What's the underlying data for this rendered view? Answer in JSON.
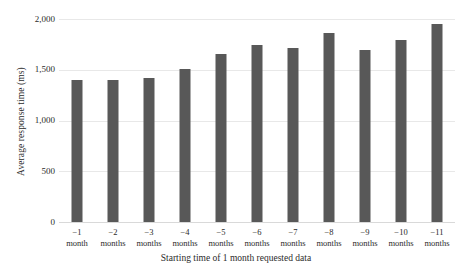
{
  "chart_data": {
    "type": "bar",
    "title": "",
    "subtitle": "",
    "xlabel": "Starting time of 1 month requested data",
    "ylabel": "Average response time (ms)",
    "ylim": [
      0,
      2000
    ],
    "yticks": [
      0,
      500,
      1000,
      1500,
      2000
    ],
    "ytick_labels": [
      "0",
      "500",
      "1,000",
      "1,500",
      "2,000"
    ],
    "grid": true,
    "legend": null,
    "bar_color": "#585858",
    "grid_color": "#e8e8e8",
    "categories": [
      "−1 month",
      "−2 months",
      "−3 months",
      "−4 months",
      "−5 months",
      "−6 months",
      "−7 months",
      "−8 months",
      "−9 months",
      "−10 months",
      "−11 months"
    ],
    "category_lines": [
      [
        "−1",
        "month"
      ],
      [
        "−2",
        "months"
      ],
      [
        "−3",
        "months"
      ],
      [
        "−4",
        "months"
      ],
      [
        "−5",
        "months"
      ],
      [
        "−6",
        "months"
      ],
      [
        "−7",
        "months"
      ],
      [
        "−8",
        "months"
      ],
      [
        "−9",
        "months"
      ],
      [
        "−10",
        "months"
      ],
      [
        "−11",
        "months"
      ]
    ],
    "values": [
      1400,
      1400,
      1420,
      1510,
      1660,
      1740,
      1710,
      1860,
      1690,
      1790,
      1955
    ]
  }
}
